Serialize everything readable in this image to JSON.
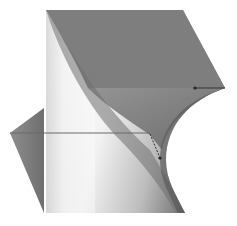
{
  "image": {
    "subject": "3D rendered twisted geometric solid",
    "width": 237,
    "height": 226,
    "colors": {
      "background": "#ffffff",
      "top_face": "#7e7e7e",
      "band": "#8a8a8a",
      "wedge": "#7a7a7a",
      "highlight": "#ffffff",
      "edge_line": "#555555",
      "marker": "#222222"
    }
  }
}
